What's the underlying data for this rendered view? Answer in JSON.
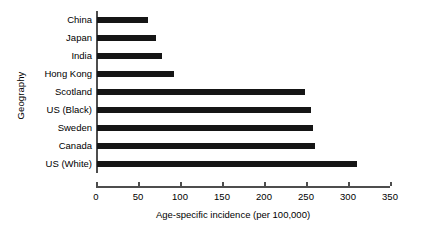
{
  "chart_data": {
    "type": "bar",
    "orientation": "horizontal",
    "title": "",
    "xlabel": "Age-specific incidence (per 100,000)",
    "ylabel": "Geography",
    "categories": [
      "China",
      "Japan",
      "India",
      "Hong Kong",
      "Scotland",
      "US (Black)",
      "Sweden",
      "Canada",
      "US (White)"
    ],
    "values": [
      61,
      70,
      77,
      92,
      248,
      255,
      257,
      259,
      310
    ],
    "xlim": [
      0,
      350
    ],
    "xticks": [
      0,
      50,
      100,
      150,
      200,
      250,
      300,
      350
    ],
    "xtick_labels": [
      "0",
      "50",
      "100",
      "150",
      "200",
      "250",
      "300",
      "350"
    ],
    "grid": false,
    "legend": false,
    "bar_color": "#151515",
    "axis_color": "#4d4d4d",
    "background_color": "#ffffff"
  }
}
